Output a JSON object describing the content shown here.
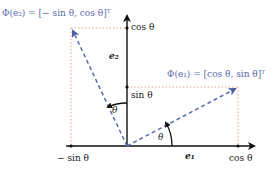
{
  "diagram": {
    "colors": {
      "axis": "#111111",
      "rotated_vector": "#5a6aa8",
      "projection_dotted": "#e8a08a",
      "text": "#1a1a1a"
    },
    "axes": {
      "e1_label": "e₁",
      "e2_label": "e₂"
    },
    "vectors": {
      "phi_e1_label": "Φ(e₁) = [cos θ, sin θ]ᵀ",
      "phi_e2_label": "Φ(e₂) = [− sin θ, cos θ]ᵀ"
    },
    "ticks": {
      "y_cos": "cos θ",
      "y_sin": "sin θ",
      "x_neg_sin": "− sin θ",
      "x_cos": "cos θ"
    },
    "angles": {
      "theta_e1": "θ",
      "theta_e2": "θ"
    }
  }
}
